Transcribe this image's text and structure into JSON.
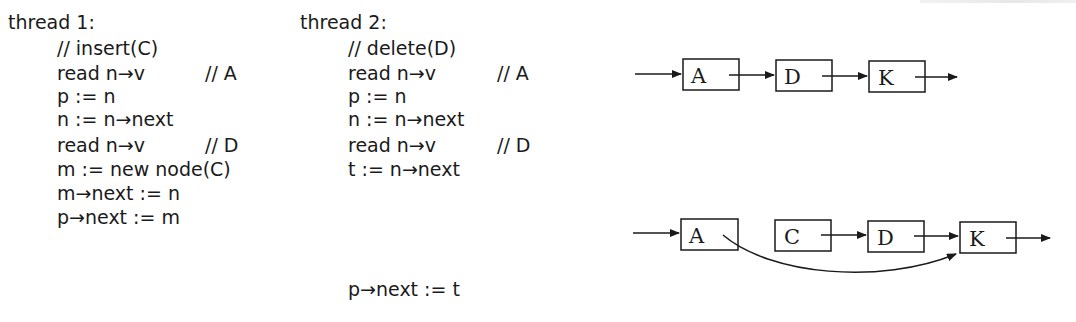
{
  "thread1": {
    "title": "thread 1:",
    "lines": [
      {
        "code": "// insert(C)",
        "comment": ""
      },
      {
        "code": "read n→v",
        "comment": "// A"
      },
      {
        "code": "p := n",
        "comment": ""
      },
      {
        "code": "n := n→next",
        "comment": ""
      },
      {
        "code": "read n→v",
        "comment": "// D"
      },
      {
        "code": "m := new node(C)",
        "comment": ""
      },
      {
        "code": "m→next := n",
        "comment": ""
      },
      {
        "code": "p→next := m",
        "comment": ""
      }
    ]
  },
  "thread2": {
    "title": "thread 2:",
    "lines": [
      {
        "code": "// delete(D)",
        "comment": ""
      },
      {
        "code": "read n→v",
        "comment": "// A"
      },
      {
        "code": "p := n",
        "comment": ""
      },
      {
        "code": "n := n→next",
        "comment": ""
      },
      {
        "code": "read n→v",
        "comment": "// D"
      },
      {
        "code": "t := n→next",
        "comment": ""
      }
    ],
    "final_line": "p→next := t"
  },
  "diagram_before": {
    "nodes": [
      "A",
      "D",
      "K"
    ]
  },
  "diagram_after": {
    "nodes": [
      "A",
      "C",
      "D",
      "K"
    ],
    "bypass_edge": {
      "from": "A",
      "to": "K"
    }
  },
  "colors": {
    "ink": "#1a1a1a",
    "background": "#ffffff"
  }
}
